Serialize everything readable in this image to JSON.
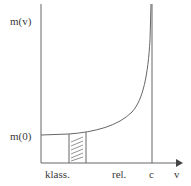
{
  "diagram": {
    "y_axis_label": "m(v)",
    "y_value_label": "m(0)",
    "x_axis_label": "v",
    "x_labels": {
      "classical": "klass.",
      "relativistic": "rel.",
      "limit": "c"
    },
    "colors": {
      "line": "#555555",
      "background": "#ffffff"
    }
  }
}
